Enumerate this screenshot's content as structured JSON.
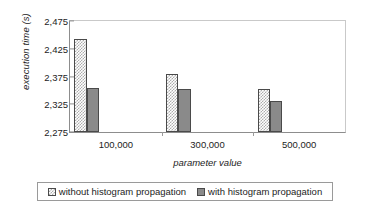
{
  "chart_data": {
    "type": "bar",
    "title": "",
    "xlabel": "parameter value",
    "ylabel": "execution time (s)",
    "categories": [
      "100,000",
      "300,000",
      "500,000"
    ],
    "ylim": [
      2275,
      2475
    ],
    "yticks": [
      2475,
      2425,
      2375,
      2325,
      2275
    ],
    "ytick_labels": [
      "2,475",
      "2,425",
      "2,375",
      "2,325",
      "2,275"
    ],
    "grid": false,
    "legend_position": "bottom",
    "series": [
      {
        "name": "without histogram propagation",
        "pattern": "checker",
        "color": "#adadad",
        "values": [
          2442,
          2380,
          2352
        ]
      },
      {
        "name": "with histogram propagation",
        "pattern": "solid",
        "color": "#8a8a8a",
        "values": [
          2355,
          2352,
          2331
        ]
      }
    ]
  },
  "axes": {
    "y_title": "execution time (s)",
    "x_title": "parameter value"
  },
  "legend": {
    "items": [
      {
        "label": "without histogram propagation"
      },
      {
        "label": "with histogram propagation"
      }
    ]
  }
}
